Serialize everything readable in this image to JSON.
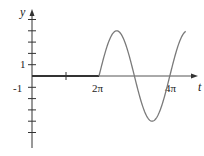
{
  "chart_data": {
    "type": "line",
    "title": "",
    "xlabel": "t",
    "ylabel": "y",
    "x_tick_labels": [
      "2π",
      "4π"
    ],
    "x_ticks": [
      {
        "value": "π",
        "label": ""
      },
      {
        "value": "2π",
        "label": "2π"
      },
      {
        "value": "4π",
        "label": "4π"
      }
    ],
    "y_tick_labels": [
      "1",
      "-1"
    ],
    "y_ticks": [
      -5,
      -4,
      -3,
      -2,
      -1,
      1,
      2,
      3,
      4,
      5
    ],
    "xlim": [
      0,
      4.5
    ],
    "xlim_units": "multiples of π",
    "ylim": [
      -5.5,
      5.5
    ],
    "grid": false,
    "legend": null,
    "series": [
      {
        "name": "y(t)",
        "description": "y = 0 for 0 ≤ t < 2π; y = 4 sin t for t ≥ 2π",
        "x": [
          "0",
          "π",
          "2π",
          "2.5π",
          "3π",
          "3.5π",
          "4π",
          "4.5π"
        ],
        "y": [
          0,
          0,
          0,
          4,
          0,
          -4,
          0,
          4
        ],
        "color": "#7a7a7a"
      }
    ],
    "baseline_color": "#333333"
  },
  "labels": {
    "y_axis": "y",
    "t_axis": "t",
    "tick_1": "1",
    "tick_neg1": "-1",
    "tick_2pi": "2π",
    "tick_4pi": "4π"
  }
}
